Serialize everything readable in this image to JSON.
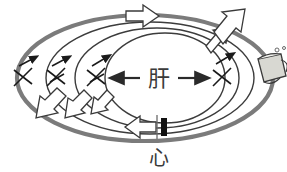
{
  "diagram": {
    "center_label": "肝",
    "bottom_label": "心",
    "colors": {
      "outer_loop": "#7b7b7b",
      "inner_loop": "#3c3c3c",
      "arrow_outline": "#3a3a3a",
      "arrow_fill": "#ffffff",
      "valve_black": "#111111",
      "text": "#3a3a3a",
      "mug_fill": "#d8d8d2",
      "background": "#ffffff"
    },
    "loops": [
      {
        "name": "outer-loop",
        "rx": 128,
        "ry": 63,
        "stroke_width": 4.2,
        "color": "#7b7b7b"
      },
      {
        "name": "loop-2",
        "rx": 104,
        "ry": 56,
        "stroke_width": 1.5,
        "color": "#3c3c3c"
      },
      {
        "name": "loop-3",
        "rx": 82,
        "ry": 50,
        "stroke_width": 1.5,
        "color": "#3c3c3c"
      },
      {
        "name": "loop-4",
        "rx": 60,
        "ry": 45,
        "stroke_width": 1.5,
        "color": "#3c3c3c"
      }
    ],
    "center_arrows": [
      {
        "name": "arrow-left-thin",
        "direction": "left"
      },
      {
        "name": "arrow-right-thin",
        "direction": "right"
      }
    ],
    "cut_marks": [
      {
        "name": "cut-mark-1",
        "x": 24,
        "y": 77
      },
      {
        "name": "cut-mark-2",
        "x": 57,
        "y": 77
      },
      {
        "name": "cut-mark-3",
        "x": 97,
        "y": 77
      },
      {
        "name": "cut-mark-4",
        "x": 222,
        "y": 76
      }
    ],
    "block_arrows": [
      {
        "name": "block-arrow-top",
        "direction": "right"
      },
      {
        "name": "block-arrow-upper-right-small",
        "direction": "up-right"
      },
      {
        "name": "block-arrow-upper-right-large",
        "direction": "up-right"
      },
      {
        "name": "block-arrow-bottom-left-1",
        "direction": "down-left"
      },
      {
        "name": "block-arrow-bottom-left-2",
        "direction": "down-left"
      },
      {
        "name": "block-arrow-bottom-left-3",
        "direction": "down-left"
      },
      {
        "name": "block-arrow-bottom-center",
        "direction": "left"
      }
    ],
    "valve": {
      "name": "heart-valve-marker",
      "tick": "|",
      "bar": "█"
    },
    "mug": {
      "name": "beer-mug-icon",
      "label": ""
    }
  }
}
